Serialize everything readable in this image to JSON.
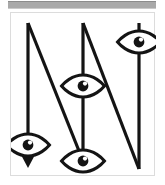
{
  "window": {
    "title": "Visibility Path Diagram",
    "background_color": "#ffffff"
  },
  "topbar": {
    "name": "horizontal-scrollbar",
    "thumb_color": "#a9a9a9",
    "track_color": "#ffffff"
  },
  "canvas": {
    "label": "Zigzag path with visibility markers",
    "border_color": "#dcdcdc",
    "background_color": "#ffffff",
    "stroke_color": "#141414",
    "stroke_width": "3.2"
  },
  "diagram": {
    "type": "line-path",
    "vertical_lines": [
      {
        "id": "left-vertical",
        "x": 17,
        "y_top": 10,
        "y_bottom": 152
      },
      {
        "id": "middle-vertical",
        "x": 72,
        "y_top": 10,
        "y_bottom": 148
      },
      {
        "id": "right-vertical",
        "x": 128,
        "y_top": 10,
        "y_bottom": 156
      }
    ],
    "diagonals": [
      {
        "id": "diagonal-one",
        "x1": 17,
        "y1": 10,
        "x2": 72,
        "y2": 148
      },
      {
        "id": "diagonal-two",
        "x1": 72,
        "y1": 10,
        "x2": 128,
        "y2": 156
      }
    ],
    "arrow": {
      "id": "down-arrow",
      "x": 17,
      "tip_y": 152,
      "direction": "down"
    },
    "eye_markers": [
      {
        "id": "eye-marker-left",
        "cx": 17,
        "cy": 132,
        "label": "visible"
      },
      {
        "id": "eye-marker-middle-upper",
        "cx": 72,
        "cy": 73,
        "label": "visible"
      },
      {
        "id": "eye-marker-middle-lower",
        "cx": 72,
        "cy": 148,
        "label": "visible"
      },
      {
        "id": "eye-marker-right",
        "cx": 128,
        "cy": 29,
        "label": "visible"
      }
    ]
  }
}
